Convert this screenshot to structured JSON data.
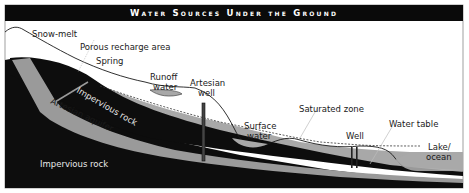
{
  "title": "Water Sources Under the Ground",
  "labels": {
    "snow_melt": "Snow-melt",
    "porous_recharge": "Porous recharge area",
    "spring": "Spring",
    "runoff_line1": "Runoff",
    "runoff_line2": "water",
    "artesian_line1": "Artesian",
    "artesian_line2": "well",
    "saturated_zone": "Saturated zone",
    "surface_line1": "Surface",
    "surface_line2": "water",
    "well": "Well",
    "water_table": "Water table",
    "lake_line1": "Lake/",
    "lake_line2": "ocean",
    "impervious_upper": "Impervious rock",
    "artesian_aquifer": "Artesian aquifer",
    "impervious_lower": "Impervious rock"
  },
  "colors": {
    "rock": "#0d0d0d",
    "aquifer": "#9a9a9a",
    "saturated": "#a8a8a8",
    "background": "#ffffff",
    "title_bar": "#0a0a0a"
  }
}
